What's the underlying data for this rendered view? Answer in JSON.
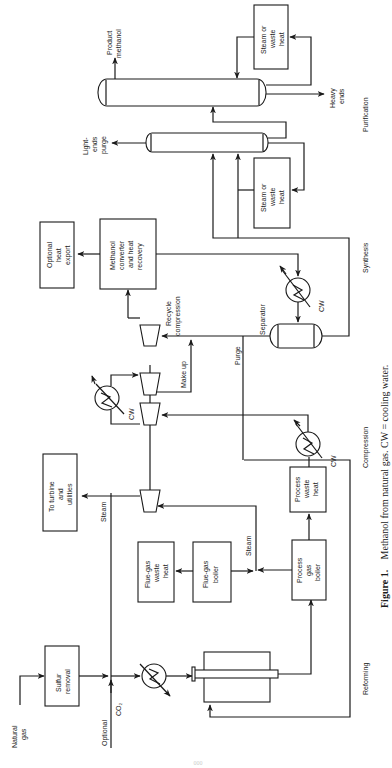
{
  "figure": {
    "number": "Figure 1.",
    "caption": "Methanol from natural gas. CW = cooling water.",
    "page_number": "000"
  },
  "sections": {
    "reforming": "Reforming",
    "compression": "Compression",
    "synthesis": "Synthesis",
    "purification": "Purification"
  },
  "units": {
    "sulfur_removal": [
      "Sulfur",
      "removal"
    ],
    "flue_gas_waste_heat": [
      "Flue-gas",
      "waste",
      "heat"
    ],
    "flue_gas_boiler": [
      "Flue-gas",
      "boiler"
    ],
    "process_gas_boiler": [
      "Process",
      "gas",
      "boiler"
    ],
    "process_waste_heat": [
      "Process",
      "waste",
      "heat"
    ],
    "to_turbine": [
      "To turbine",
      "and",
      "utilities"
    ],
    "methanol_converter": [
      "Methanol",
      "converter",
      "and heat",
      "recovery"
    ],
    "optional_heat_export": [
      "Optional",
      "heat",
      "export"
    ],
    "steam_waste_heat_1": [
      "Steam or",
      "waste",
      "heat"
    ],
    "steam_waste_heat_2": [
      "Steam or",
      "waste",
      "heat"
    ]
  },
  "streams": {
    "natural_gas": [
      "Natural",
      "gas"
    ],
    "optional_co2": [
      "Optional",
      "CO₂"
    ],
    "steam_1": "Steam",
    "steam_2": "Steam",
    "make_up": "Make up",
    "purge": "Purge",
    "recycle_compression": [
      "Recycle",
      "compression"
    ],
    "separator": "Separator",
    "cw": "CW",
    "light_ends_purge": [
      "Light-",
      "ends",
      "purge"
    ],
    "heavy_ends": [
      "Heavy",
      "ends"
    ],
    "product_methanol": [
      "Product",
      "methanol"
    ]
  }
}
